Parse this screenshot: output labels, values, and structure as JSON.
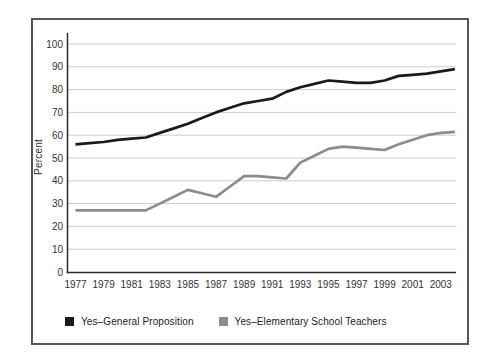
{
  "figure": {
    "border_color": "#555555",
    "background": "#ffffff"
  },
  "chart_data": {
    "type": "line",
    "title": "",
    "xlabel": "",
    "ylabel": "Percent",
    "ylim": [
      0,
      100
    ],
    "y_ticks": [
      0,
      10,
      20,
      30,
      40,
      50,
      60,
      70,
      80,
      90,
      100
    ],
    "x_tick_labels": [
      "1977",
      "1979",
      "1981",
      "1983",
      "1985",
      "1987",
      "1989",
      "1991",
      "1993",
      "1995",
      "1997",
      "1999",
      "2001",
      "2003"
    ],
    "x_range": [
      1977,
      2004
    ],
    "grid": "horizontal-only",
    "gridline_color": "#cccccc",
    "axis_color": "#2b2b2b",
    "legend_position": "bottom-left",
    "series": [
      {
        "name": "Yes–General Proposition",
        "color": "#1a1a1a",
        "x": [
          1977,
          1978,
          1979,
          1980,
          1981,
          1982,
          1983,
          1984,
          1985,
          1986,
          1987,
          1988,
          1989,
          1990,
          1991,
          1992,
          1993,
          1994,
          1995,
          1996,
          1997,
          1998,
          1999,
          2000,
          2001,
          2002,
          2003,
          2004
        ],
        "values": [
          56,
          56.5,
          57,
          58,
          58.5,
          59,
          61,
          63,
          65,
          67.5,
          70,
          72,
          74,
          75,
          76,
          79,
          81,
          82.5,
          84,
          83.5,
          83,
          83,
          84,
          86,
          86.5,
          87,
          88,
          89
        ]
      },
      {
        "name": "Yes–Elementary School Teachers",
        "color": "#8c8c8c",
        "x": [
          1977,
          1978,
          1979,
          1980,
          1981,
          1982,
          1983,
          1984,
          1985,
          1986,
          1987,
          1988,
          1989,
          1990,
          1991,
          1992,
          1993,
          1994,
          1995,
          1996,
          1997,
          1998,
          1999,
          2000,
          2001,
          2002,
          2003,
          2004
        ],
        "values": [
          27,
          27,
          27,
          27,
          27,
          27,
          30,
          33,
          36,
          34.5,
          33,
          37.5,
          42,
          42,
          41.5,
          41,
          48,
          51,
          54,
          55,
          54.5,
          54,
          53.5,
          56,
          58,
          60,
          61,
          61.5
        ]
      }
    ]
  }
}
